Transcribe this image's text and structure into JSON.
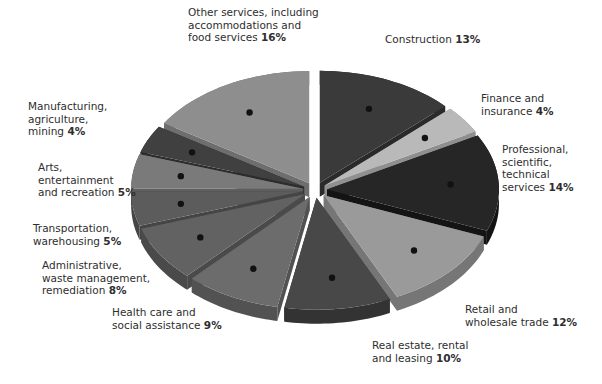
{
  "chart_data": {
    "type": "pie",
    "style": "3d-exploded",
    "title": "",
    "categories": [
      "Construction",
      "Finance and insurance",
      "Professional, scientific, technical services",
      "Retail and wholesale trade",
      "Real estate, rental and leasing",
      "Health care and social assistance",
      "Administrative, waste management, remediation",
      "Transportation, warehousing",
      "Arts, entertainment and recreation",
      "Manufacturing, agriculture, mining",
      "Other services, including accommodations and food services"
    ],
    "values": [
      13,
      4,
      14,
      12,
      10,
      9,
      8,
      5,
      5,
      4,
      16
    ],
    "unit": "%",
    "legend": "none (callout labels)"
  },
  "labels": [
    {
      "text": "Construction",
      "pct": "13%"
    },
    {
      "text": "Finance and insurance",
      "pct": "4%"
    },
    {
      "text": "Professional, scientific, technical services",
      "pct": "14%"
    },
    {
      "text": "Retail and wholesale trade",
      "pct": "12%"
    },
    {
      "text": "Real estate, rental and leasing",
      "pct": "10%"
    },
    {
      "text": "Health care and social assistance",
      "pct": "9%"
    },
    {
      "text": "Administrative, waste management, remediation",
      "pct": "8%"
    },
    {
      "text": "Transportation, warehousing",
      "pct": "5%"
    },
    {
      "text": "Arts, entertainment and recreation",
      "pct": "5%"
    },
    {
      "text": "Manufacturing, agriculture, mining",
      "pct": "4%"
    },
    {
      "text": "Other services, including accommodations and food services",
      "pct": "16%"
    }
  ]
}
